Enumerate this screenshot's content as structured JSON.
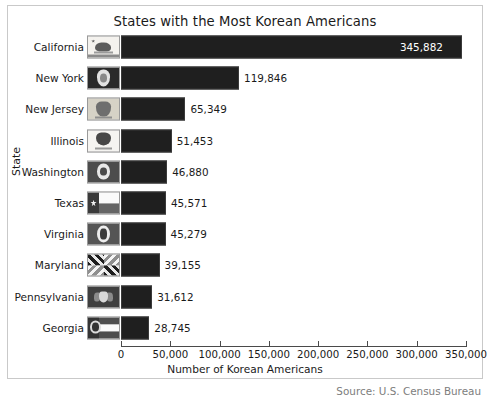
{
  "chart_data": {
    "type": "bar",
    "orientation": "horizontal",
    "title": "States with the Most Korean Americans",
    "xlabel": "Number of Korean Americans",
    "ylabel": "State",
    "xlim": [
      0,
      350000
    ],
    "xticks": [
      0,
      50000,
      100000,
      150000,
      200000,
      250000,
      300000,
      350000
    ],
    "xtick_labels": [
      "0",
      "50,000",
      "100,000",
      "150,000",
      "200,000",
      "250,000",
      "300,000",
      "350,000"
    ],
    "grid": false,
    "legend": null,
    "bar_color": "#1f1f1f",
    "categories": [
      "California",
      "New York",
      "New Jersey",
      "Illinois",
      "Washington",
      "Texas",
      "Virginia",
      "Maryland",
      "Pennsylvania",
      "Georgia"
    ],
    "values": [
      345882,
      119846,
      65349,
      51453,
      46880,
      45571,
      45279,
      39155,
      31612,
      28745
    ],
    "value_labels": [
      "345,882",
      "119,846",
      "65,349",
      "51,453",
      "46,880",
      "45,571",
      "45,279",
      "39,155",
      "31,612",
      "28,745"
    ],
    "icons": [
      "california-flag-icon",
      "new-york-flag-icon",
      "new-jersey-flag-icon",
      "illinois-flag-icon",
      "washington-flag-icon",
      "texas-flag-icon",
      "virginia-flag-icon",
      "maryland-flag-icon",
      "pennsylvania-flag-icon",
      "georgia-flag-icon"
    ]
  },
  "rows": [
    {
      "label": "California",
      "value_label": "345,882",
      "flag": "ca"
    },
    {
      "label": "New York",
      "value_label": "119,846",
      "flag": "ny"
    },
    {
      "label": "New Jersey",
      "value_label": "65,349",
      "flag": "nj"
    },
    {
      "label": "Illinois",
      "value_label": "51,453",
      "flag": "il"
    },
    {
      "label": "Washington",
      "value_label": "46,880",
      "flag": "wa"
    },
    {
      "label": "Texas",
      "value_label": "45,571",
      "flag": "tx"
    },
    {
      "label": "Virginia",
      "value_label": "45,279",
      "flag": "va"
    },
    {
      "label": "Maryland",
      "value_label": "39,155",
      "flag": "md"
    },
    {
      "label": "Pennsylvania",
      "value_label": "31,612",
      "flag": "pa"
    },
    {
      "label": "Georgia",
      "value_label": "28,745",
      "flag": "ga"
    }
  ],
  "footer": {
    "source": "Source: U.S. Census Bureau"
  }
}
